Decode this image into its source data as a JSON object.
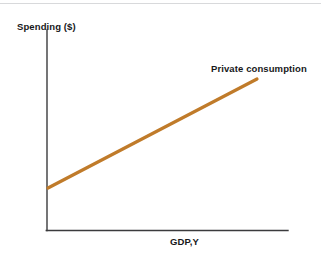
{
  "figure": {
    "width": 321,
    "height": 260,
    "background": "#ffffff",
    "top_rule_color": "#d8d9db"
  },
  "chart_data": {
    "type": "line",
    "title": "",
    "subtitle": "",
    "xlabel": "GDP,Y",
    "ylabel": "Spending ($)",
    "grid": false,
    "legend_position": "inline-annotation",
    "axis_color": "#3b3b3d",
    "xlim": [
      0,
      1
    ],
    "ylim": [
      0,
      1
    ],
    "xticks": [],
    "yticks": [],
    "xticklabels": [],
    "yticklabels": [],
    "series": [
      {
        "name": "Private consumption",
        "color": "#c07b2a",
        "linewidth": 3.2,
        "x": [
          0.004,
          1.0
        ],
        "y": [
          0.21,
          0.755
        ],
        "annotation": "Private consumption",
        "annotation_position": "above-right-end"
      }
    ],
    "annotations": [
      {
        "text": "Spending ($)",
        "role": "y-axis-title"
      },
      {
        "text": "GDP,Y",
        "role": "x-axis-title"
      },
      {
        "text": "Private consumption",
        "role": "series-label"
      }
    ]
  },
  "geometry": {
    "y_axis": {
      "x": 47,
      "y_top": 30,
      "y_bottom": 230.5
    },
    "x_axis": {
      "y": 230.5,
      "x_left": 46.3,
      "x_right": 288
    },
    "series_line": {
      "x1": 48,
      "y1": 188,
      "x2": 257,
      "y2": 79
    }
  }
}
